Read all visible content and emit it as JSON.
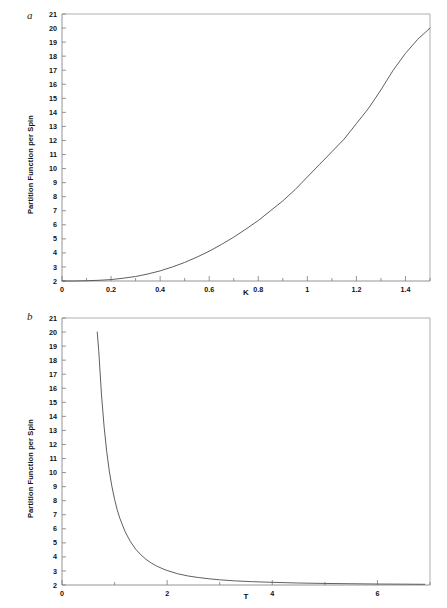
{
  "figure": {
    "background_color": "#ffffff",
    "line_color": "#4d4d4d",
    "axis_color": "#7a7a7a"
  },
  "panels": [
    {
      "letter": "a",
      "ylabel": "Partition Function per Spin",
      "xlabel": "K"
    },
    {
      "letter": "b",
      "ylabel": "Partition Function per Spin",
      "xlabel": "T"
    }
  ],
  "chart_data": [
    {
      "type": "line",
      "title": "",
      "panel_label": "a",
      "xlabel": "K",
      "ylabel": "Partition Function per Spin",
      "xlim": [
        0,
        1.5
      ],
      "ylim": [
        2,
        21
      ],
      "grid": false,
      "legend": "none",
      "xticks": [
        0,
        0.2,
        0.4,
        0.6,
        0.8,
        1,
        1.2,
        1.4
      ],
      "xtick_labels": [
        "0",
        "0.2",
        "0.4",
        "0.6",
        "0.8",
        "1",
        "1.2",
        "1.4"
      ],
      "xminor_ticks": [
        0.1,
        0.3,
        0.5,
        0.7,
        0.9,
        1.1,
        1.3,
        1.5
      ],
      "yticks": [
        2,
        3,
        4,
        5,
        6,
        7,
        8,
        9,
        10,
        11,
        12,
        13,
        14,
        15,
        16,
        17,
        18,
        19,
        20,
        21
      ],
      "ytick_labels": [
        "2",
        "3",
        "4",
        "5",
        "6",
        "7",
        "8",
        "9",
        "10",
        "11",
        "12",
        "13",
        "14",
        "15",
        "16",
        "17",
        "18",
        "19",
        "20",
        "21"
      ],
      "series": [
        {
          "name": "Z per spin vs K",
          "x": [
            0,
            0.05,
            0.1,
            0.15,
            0.2,
            0.25,
            0.3,
            0.35,
            0.4,
            0.45,
            0.5,
            0.55,
            0.6,
            0.65,
            0.7,
            0.75,
            0.8,
            0.85,
            0.9,
            0.95,
            1.0,
            1.05,
            1.1,
            1.15,
            1.2,
            1.25,
            1.3,
            1.35,
            1.4,
            1.45,
            1.5
          ],
          "y": [
            2.0,
            2.0,
            2.02,
            2.05,
            2.1,
            2.2,
            2.32,
            2.5,
            2.72,
            3.0,
            3.32,
            3.7,
            4.12,
            4.6,
            5.12,
            5.7,
            6.3,
            7.0,
            7.7,
            8.5,
            9.4,
            10.3,
            11.2,
            12.1,
            13.2,
            14.3,
            15.6,
            17.0,
            18.2,
            19.2,
            20.0
          ]
        }
      ]
    },
    {
      "type": "line",
      "title": "",
      "panel_label": "b",
      "xlabel": "T",
      "ylabel": "Partition Function per Spin",
      "xlim": [
        0,
        7
      ],
      "ylim": [
        2,
        21
      ],
      "grid": false,
      "legend": "none",
      "xticks": [
        0,
        2,
        4,
        6
      ],
      "xtick_labels": [
        "0",
        "2",
        "4",
        "6"
      ],
      "xminor_ticks": [
        1,
        3,
        5,
        7
      ],
      "yticks": [
        2,
        3,
        4,
        5,
        6,
        7,
        8,
        9,
        10,
        11,
        12,
        13,
        14,
        15,
        16,
        17,
        18,
        19,
        20,
        21
      ],
      "ytick_labels": [
        "2",
        "3",
        "4",
        "5",
        "6",
        "7",
        "8",
        "9",
        "10",
        "11",
        "12",
        "13",
        "14",
        "15",
        "16",
        "17",
        "18",
        "19",
        "20",
        "21"
      ],
      "series": [
        {
          "name": "Z per spin vs T",
          "x": [
            0.67,
            0.7,
            0.75,
            0.8,
            0.85,
            0.9,
            0.95,
            1.0,
            1.05,
            1.1,
            1.2,
            1.3,
            1.4,
            1.5,
            1.6,
            1.7,
            1.8,
            1.9,
            2.0,
            2.2,
            2.4,
            2.6,
            2.8,
            3.0,
            3.3,
            3.6,
            4.0,
            4.5,
            5.0,
            5.5,
            6.0,
            6.5,
            6.9
          ],
          "y": [
            20.0,
            18.6,
            15.6,
            13.3,
            11.5,
            10.1,
            9.0,
            8.1,
            7.35,
            6.75,
            5.8,
            5.1,
            4.55,
            4.15,
            3.82,
            3.56,
            3.35,
            3.18,
            3.03,
            2.8,
            2.64,
            2.53,
            2.44,
            2.37,
            2.29,
            2.24,
            2.19,
            2.14,
            2.11,
            2.09,
            2.07,
            2.06,
            2.05
          ]
        }
      ]
    }
  ]
}
